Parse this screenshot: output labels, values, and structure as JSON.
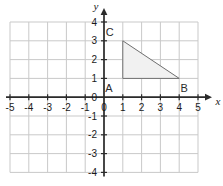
{
  "chart_data": {
    "type": "scatter",
    "title": "",
    "xlabel": "x",
    "ylabel": "y",
    "xlim": [
      -5,
      5
    ],
    "ylim": [
      -4,
      4
    ],
    "grid": true,
    "legend": "none",
    "x_ticks": [
      "-5",
      "-4",
      "-3",
      "-2",
      "-1",
      "0",
      "1",
      "2",
      "3",
      "4",
      "5"
    ],
    "x_tick_values": [
      -5,
      -4,
      -3,
      -2,
      -1,
      0,
      1,
      2,
      3,
      4,
      5
    ],
    "y_ticks": [
      "4",
      "3",
      "2",
      "1",
      "0",
      "-1",
      "-2",
      "-3",
      "-4"
    ],
    "y_tick_values": [
      4,
      3,
      2,
      1,
      0,
      -1,
      -2,
      -3,
      -4
    ],
    "origin_label": "0",
    "shapes": [
      {
        "name": "triangle-ABC",
        "kind": "polygon",
        "fill": "#f1f1f1",
        "stroke": "#6e6e6e",
        "vertices": [
          {
            "label": "A",
            "x": 1,
            "y": 1
          },
          {
            "label": "B",
            "x": 4,
            "y": 1
          },
          {
            "label": "C",
            "x": 1,
            "y": 3
          }
        ]
      }
    ],
    "vertex_labels": [
      {
        "label": "A",
        "x": 1,
        "y": 1,
        "dx": -14,
        "dy": 14
      },
      {
        "label": "B",
        "x": 4,
        "y": 1,
        "dx": 5,
        "dy": 14
      },
      {
        "label": "C",
        "x": 1,
        "y": 3,
        "dx": -13,
        "dy": -5
      }
    ],
    "colors": {
      "grid": "#c9c9c9",
      "axis": "#2b2b2b",
      "triangle_fill": "#f1f1f1",
      "triangle_stroke": "#6e6e6e",
      "text": "#1a1a1a",
      "background": "#ffffff"
    }
  },
  "axes": {
    "x_axis_name": "x",
    "y_axis_name": "y"
  }
}
